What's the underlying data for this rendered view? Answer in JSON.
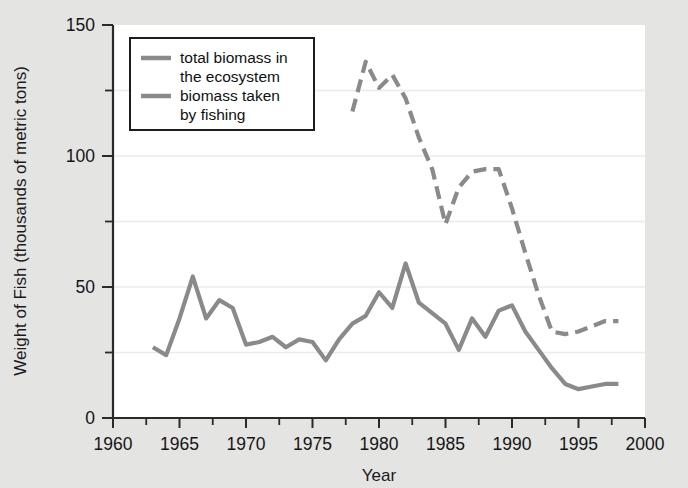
{
  "chart_data": {
    "type": "line",
    "title": "",
    "xlabel": "Year",
    "ylabel": "Weight of Fish (thousands of metric tons)",
    "xlim": [
      1960,
      2000
    ],
    "ylim": [
      0,
      150
    ],
    "x_ticks": [
      1960,
      1965,
      1970,
      1975,
      1980,
      1985,
      1990,
      1995,
      2000
    ],
    "x_minor_ticks": [
      1962.5,
      1967.5,
      1972.5,
      1977.5,
      1982.5,
      1987.5,
      1992.5,
      1997.5
    ],
    "y_ticks": [
      0,
      50,
      100,
      150
    ],
    "y_minor_ticks": [
      25,
      75,
      125
    ],
    "grid": "horizontal-faint",
    "legend_position": "top-left-inside",
    "series": [
      {
        "name": "total biomass in the ecosystem",
        "style": "dashed",
        "color": "#8a8a8a",
        "points": [
          [
            1978,
            117
          ],
          [
            1979,
            136
          ],
          [
            1980,
            126
          ],
          [
            1981,
            131
          ],
          [
            1982,
            122
          ],
          [
            1983,
            107
          ],
          [
            1984,
            95
          ],
          [
            1985,
            74
          ],
          [
            1986,
            88
          ],
          [
            1987,
            94
          ],
          [
            1988,
            95
          ],
          [
            1989,
            95
          ],
          [
            1990,
            80
          ],
          [
            1991,
            63
          ],
          [
            1992,
            47
          ],
          [
            1993,
            33
          ],
          [
            1994,
            32
          ],
          [
            1995,
            33
          ],
          [
            1996,
            35
          ],
          [
            1997,
            37
          ],
          [
            1998,
            37
          ]
        ]
      },
      {
        "name": "biomass taken by fishing",
        "style": "solid",
        "color": "#8a8a8a",
        "points": [
          [
            1963,
            27
          ],
          [
            1964,
            24
          ],
          [
            1965,
            38
          ],
          [
            1966,
            54
          ],
          [
            1967,
            38
          ],
          [
            1968,
            45
          ],
          [
            1969,
            42
          ],
          [
            1970,
            28
          ],
          [
            1971,
            29
          ],
          [
            1972,
            31
          ],
          [
            1973,
            27
          ],
          [
            1974,
            30
          ],
          [
            1975,
            29
          ],
          [
            1976,
            22
          ],
          [
            1977,
            30
          ],
          [
            1978,
            36
          ],
          [
            1979,
            39
          ],
          [
            1980,
            48
          ],
          [
            1981,
            42
          ],
          [
            1982,
            59
          ],
          [
            1983,
            44
          ],
          [
            1984,
            40
          ],
          [
            1985,
            36
          ],
          [
            1986,
            26
          ],
          [
            1987,
            38
          ],
          [
            1988,
            31
          ],
          [
            1989,
            41
          ],
          [
            1990,
            43
          ],
          [
            1991,
            33
          ],
          [
            1992,
            26
          ],
          [
            1993,
            19
          ],
          [
            1994,
            13
          ],
          [
            1995,
            11
          ],
          [
            1996,
            12
          ],
          [
            1997,
            13
          ],
          [
            1998,
            13
          ]
        ]
      }
    ],
    "legend_entries": [
      {
        "line1": "total biomass in",
        "line2": "the ecosystem",
        "style": "dashed"
      },
      {
        "line1": "biomass taken",
        "line2": "by fishing",
        "style": "solid"
      }
    ],
    "colors": {
      "background": "#e4e4e3",
      "plot_background": "#ffffff",
      "line": "#8a8a8a",
      "axis": "#2a2a2a",
      "grid": "#ebebeb",
      "text": "#141414"
    }
  }
}
